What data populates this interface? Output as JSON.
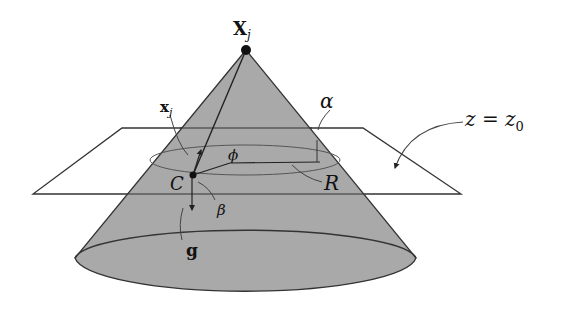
{
  "diagram": {
    "labels": {
      "apex": "X",
      "apex_sub": "j",
      "point_x": "x",
      "point_x_sub": "j",
      "alpha": "α",
      "phi": "ϕ",
      "C": "C",
      "R": "R",
      "beta": "β",
      "g": "g",
      "plane_z": "z = z",
      "plane_z_sub": "0"
    },
    "colors": {
      "cone_fill": "#a9a9a9",
      "stroke": "#222222",
      "background": "#ffffff"
    }
  }
}
